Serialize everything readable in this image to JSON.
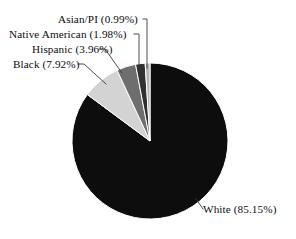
{
  "chart_data": {
    "type": "pie",
    "title": "",
    "subtitle": "",
    "xlabel": "",
    "ylabel": "",
    "legend_position": "callout-labels",
    "grid": false,
    "total_percent": 100.0,
    "start_angle_deg": 90,
    "direction": "clockwise",
    "categories": [
      "White",
      "Black",
      "Hispanic",
      "Native American",
      "Asian/PI"
    ],
    "values": [
      85.15,
      7.92,
      3.96,
      1.98,
      0.99
    ],
    "slices": [
      {
        "name": "White",
        "value": 85.15,
        "label": "White (85.15%)",
        "percent_text": "85.15%",
        "color": "#0d0d0d"
      },
      {
        "name": "Black",
        "value": 7.92,
        "label": "Black (7.92%)",
        "percent_text": "7.92%",
        "color": "#d3d3d3"
      },
      {
        "name": "Hispanic",
        "value": 3.96,
        "label": "Hispanic (3.96%)",
        "percent_text": "3.96%",
        "color": "#6e6e6e"
      },
      {
        "name": "Native American",
        "value": 1.98,
        "label": "Native American (1.98%)",
        "percent_text": "1.98%",
        "color": "#303030"
      },
      {
        "name": "Asian/PI",
        "value": 0.99,
        "label": "Asian/PI (0.99%)",
        "percent_text": "0.99%",
        "color": "#b4b4b4"
      }
    ]
  },
  "labels": {
    "asian": "Asian/PI (0.99%)",
    "native": "Native American (1.98%)",
    "hispanic": "Hispanic (3.96%)",
    "black": "Black (7.92%)",
    "white": "White (85.15%)"
  },
  "colors": {
    "background": "#ffffff",
    "text": "#0d0d0d",
    "leader_line": "#3a3a3a",
    "white_slice": "#0d0d0d",
    "black_slice": "#d3d3d3",
    "hispanic_slice": "#6e6e6e",
    "native_slice": "#303030",
    "asian_slice": "#b4b4b4"
  }
}
